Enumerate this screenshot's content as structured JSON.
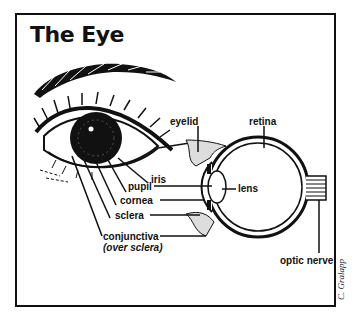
{
  "diagram": {
    "title": "The Eye",
    "labels": {
      "eyelid": "eyelid",
      "retina": "retina",
      "iris": "iris",
      "pupil": "pupil",
      "lens": "lens",
      "cornea": "cornea",
      "sclera": "sclera",
      "conjunctiva": "conjunctiva",
      "conjunctiva_note": "(over sclera)",
      "optic_nerve": "optic nerve"
    },
    "credit": "C. Gralapp",
    "colors": {
      "ink": "#111111",
      "background": "#ffffff"
    }
  }
}
